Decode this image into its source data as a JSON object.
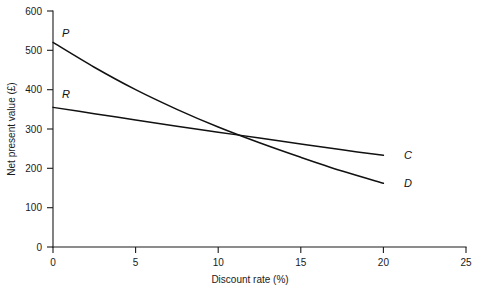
{
  "chart_data": {
    "type": "line",
    "title": "",
    "xlabel": "Discount rate (%)",
    "ylabel": "Net present value (£)",
    "xlim": [
      0,
      25
    ],
    "ylim": [
      0,
      600
    ],
    "xticks": [
      0,
      5,
      10,
      15,
      20,
      25
    ],
    "xtick_labels": [
      "0",
      "5",
      "10",
      "15",
      "20",
      "25"
    ],
    "yticks": [
      0,
      100,
      200,
      300,
      400,
      500,
      600
    ],
    "ytick_labels": [
      "0",
      "100",
      "200",
      "300",
      "400",
      "500",
      "600"
    ],
    "grid": false,
    "legend": "none",
    "annotations": [
      {
        "text": "P",
        "x": 0.45,
        "y": 545,
        "note": "start label of project D curve"
      },
      {
        "text": "R",
        "x": 0.45,
        "y": 382,
        "note": "start label of project C curve"
      },
      {
        "text": "C",
        "x": 21.2,
        "y": 233,
        "note": "end label of flatter curve"
      },
      {
        "text": "D",
        "x": 21.2,
        "y": 162,
        "note": "end label of steeper curve"
      }
    ],
    "series": [
      {
        "name": "D",
        "start_label": "P",
        "end_label": "D",
        "x": [
          0,
          2.5,
          5,
          7.5,
          10,
          12.5,
          15,
          17.5,
          20
        ],
        "values": [
          520,
          457,
          400,
          350,
          305,
          265,
          228,
          193,
          162
        ]
      },
      {
        "name": "C",
        "start_label": "R",
        "end_label": "C",
        "x": [
          0,
          2.5,
          5,
          7.5,
          10,
          12.5,
          15,
          17.5,
          20
        ],
        "values": [
          355,
          339,
          323,
          307,
          292,
          277,
          262,
          247,
          233
        ]
      }
    ]
  },
  "axes": {
    "y_title": "Net present value (£)",
    "x_title": "Discount rate (%)"
  },
  "colors": {
    "background": "#ffffff",
    "ink": "#111111",
    "axis": "#1a1a1a"
  }
}
